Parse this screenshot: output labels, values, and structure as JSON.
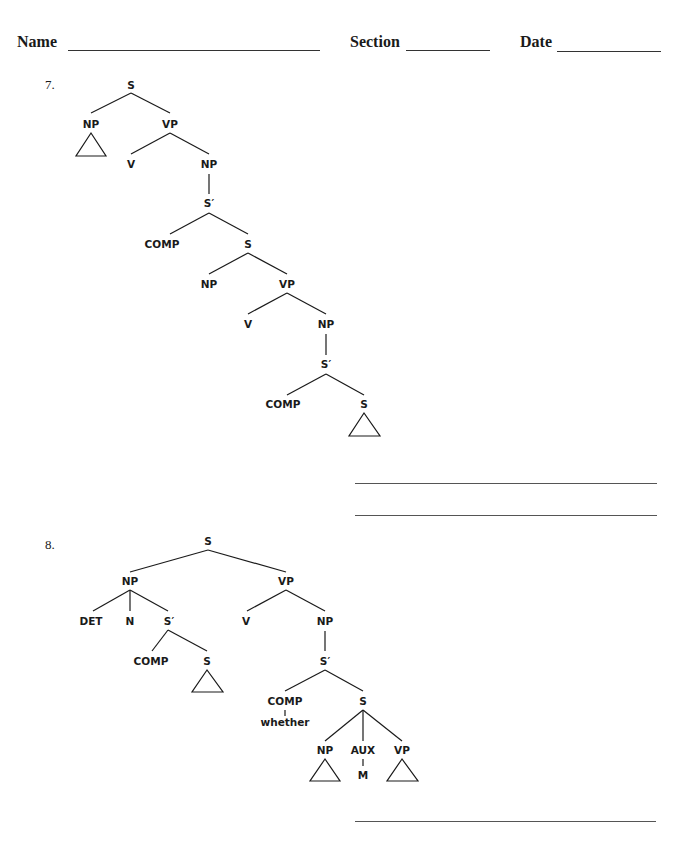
{
  "header": {
    "name_label": "Name",
    "section_label": "Section",
    "date_label": "Date"
  },
  "questions": [
    {
      "number": "7.",
      "nodes": {
        "s": "S",
        "np1": "NP",
        "vp1": "VP",
        "v1": "V",
        "np2": "NP",
        "sbar1": "S′",
        "comp1": "COMP",
        "s2": "S",
        "np3": "NP",
        "vp2": "VP",
        "v2": "V",
        "np4": "NP",
        "sbar2": "S′",
        "comp2": "COMP",
        "s3": "S"
      },
      "answer_lines": 2
    },
    {
      "number": "8.",
      "nodes": {
        "s": "S",
        "np1": "NP",
        "vp1": "VP",
        "det": "DET",
        "n": "N",
        "sbar1": "S′",
        "comp1": "COMP",
        "s2": "S",
        "v": "V",
        "np2": "NP",
        "sbar2": "S′",
        "comp2": "COMP",
        "whether": "whether",
        "s3": "S",
        "np3": "NP",
        "aux": "AUX",
        "m": "M",
        "vp2": "VP"
      },
      "answer_lines": 1
    }
  ]
}
